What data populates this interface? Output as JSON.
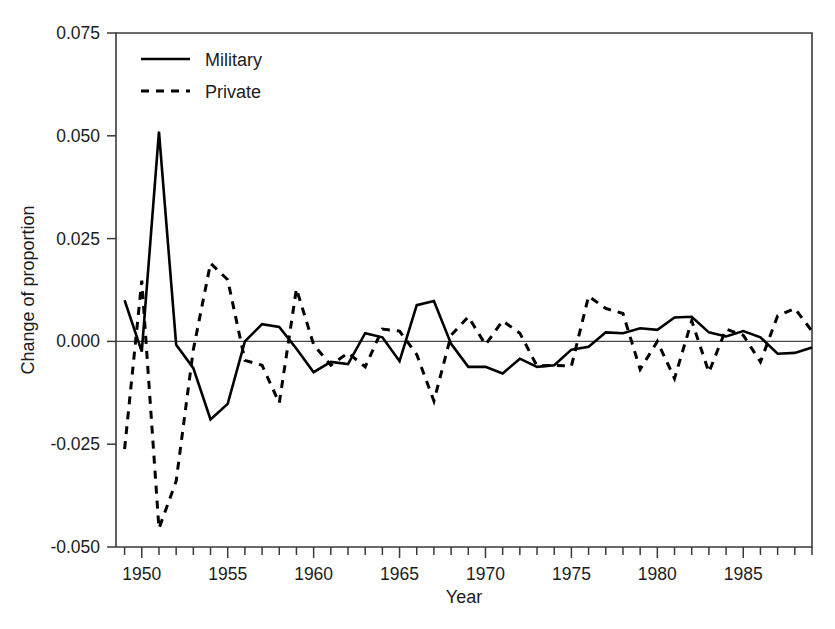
{
  "chart_data": {
    "type": "line",
    "title": "",
    "xlabel": "Year",
    "ylabel": "Change of proportion",
    "xlim": [
      1948.5,
      1989.0
    ],
    "ylim": [
      -0.05,
      0.075
    ],
    "grid": false,
    "legend_position": "top-left",
    "yticks": [
      0.075,
      0.05,
      0.025,
      0.0,
      -0.025,
      -0.05
    ],
    "ytick_labels": [
      "0.075",
      "0.050",
      "0.025",
      "0.000",
      "-0.025",
      "-0.050"
    ],
    "xticks": [
      1950,
      1955,
      1960,
      1965,
      1970,
      1975,
      1980,
      1985
    ],
    "xtick_labels": [
      "1950",
      "1955",
      "1960",
      "1965",
      "1970",
      "1975",
      "1980",
      "1985"
    ],
    "xtick_minor_step": 1,
    "zero_reference_line": 0.0,
    "x": [
      1949,
      1950,
      1951,
      1952,
      1953,
      1954,
      1955,
      1956,
      1957,
      1958,
      1959,
      1960,
      1961,
      1962,
      1963,
      1964,
      1965,
      1966,
      1967,
      1968,
      1969,
      1970,
      1971,
      1972,
      1973,
      1974,
      1975,
      1976,
      1977,
      1978,
      1979,
      1980,
      1981,
      1982,
      1983,
      1984,
      1985,
      1986,
      1987,
      1988,
      1989
    ],
    "series": [
      {
        "name": "Military",
        "style": "solid",
        "color": "#000000",
        "values": [
          0.01,
          -0.0025,
          0.051,
          -0.0008,
          -0.0065,
          -0.019,
          -0.0152,
          0.0,
          0.0042,
          0.0035,
          -0.0018,
          -0.0075,
          -0.005,
          -0.0055,
          0.002,
          0.001,
          -0.0048,
          0.0088,
          0.0098,
          -0.0006,
          -0.0062,
          -0.0062,
          -0.0078,
          -0.0042,
          -0.0062,
          -0.0058,
          -0.002,
          -0.0013,
          0.0022,
          0.002,
          0.0032,
          0.0028,
          0.0058,
          0.006,
          0.0022,
          0.0012,
          0.0025,
          0.001,
          -0.003,
          -0.0028,
          -0.0015
        ]
      },
      {
        "name": "Private",
        "style": "dashed",
        "color": "#000000",
        "values": [
          -0.0262,
          0.0148,
          -0.0455,
          -0.034,
          -0.002,
          0.019,
          0.015,
          -0.0046,
          -0.0058,
          -0.015,
          0.0128,
          -0.0008,
          -0.0058,
          -0.0028,
          -0.0062,
          0.003,
          0.0025,
          -0.0032,
          -0.0145,
          0.0015,
          0.006,
          -0.0008,
          0.005,
          0.002,
          -0.006,
          -0.0058,
          -0.006,
          0.011,
          0.008,
          0.0068,
          -0.0068,
          0.0,
          -0.009,
          0.005,
          -0.0075,
          0.003,
          0.0015,
          -0.005,
          0.0062,
          0.008,
          0.0025
        ]
      }
    ],
    "legend": [
      {
        "label": "Military",
        "style": "solid"
      },
      {
        "label": "Private",
        "style": "dashed"
      }
    ]
  }
}
